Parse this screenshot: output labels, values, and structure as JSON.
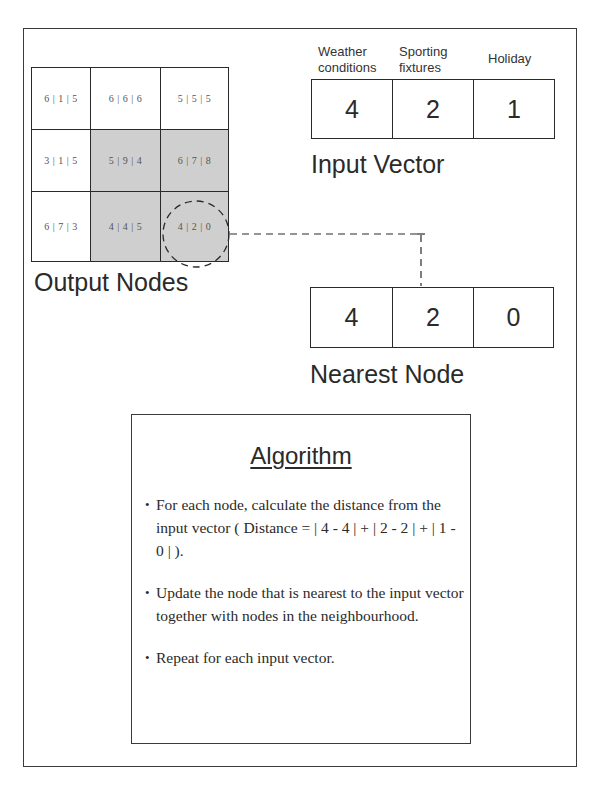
{
  "output_nodes": {
    "label": "Output Nodes",
    "grid": [
      [
        {
          "value": "6 | 1 | 5",
          "shaded": false
        },
        {
          "value": "6 | 6 | 6",
          "shaded": false
        },
        {
          "value": "5 | 5 | 5",
          "shaded": false
        }
      ],
      [
        {
          "value": "3 | 1 | 5",
          "shaded": false
        },
        {
          "value": "5 | 9 | 4",
          "shaded": true
        },
        {
          "value": "6 | 7 | 8",
          "shaded": true
        }
      ],
      [
        {
          "value": "6 | 7 | 3",
          "shaded": false
        },
        {
          "value": "4 | 4 | 5",
          "shaded": true
        },
        {
          "value": "4 | 2 | 0",
          "shaded": true,
          "highlighted": true
        }
      ]
    ]
  },
  "input_vector": {
    "label": "Input Vector",
    "headers": [
      {
        "line1": "Weather",
        "line2": "conditions"
      },
      {
        "line1": "Sporting",
        "line2": "fixtures"
      },
      {
        "line1": "Holiday",
        "line2": ""
      }
    ],
    "values": [
      "4",
      "2",
      "1"
    ]
  },
  "nearest_node": {
    "label": "Nearest Node",
    "values": [
      "4",
      "2",
      "0"
    ]
  },
  "algorithm": {
    "title": "Algorithm",
    "steps": [
      "For each node, calculate the distance from the input vector ( Distance = | 4 - 4 | + | 2 - 2 | + | 1 - 0 | ).",
      "Update the node that is nearest to the input vector together with nodes in the neighbourhood.",
      "Repeat for each input vector."
    ]
  },
  "colors": {
    "shaded_node": "#cfcfcf",
    "line": "#2a2a2a"
  }
}
